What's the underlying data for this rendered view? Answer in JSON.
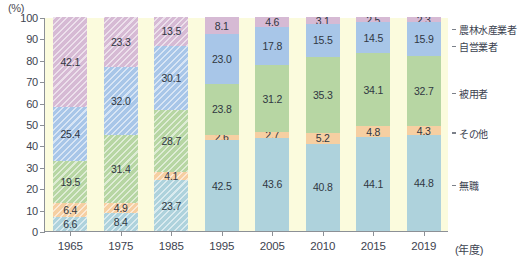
{
  "chart": {
    "type": "bar",
    "title": "",
    "unit_label": "(%)",
    "xlabel": "(年度)",
    "ylabel": "",
    "ylim": [
      0,
      100
    ],
    "ytick_labels": [
      "0",
      "10",
      "20",
      "30",
      "40",
      "50",
      "60",
      "70",
      "80",
      "90",
      "100"
    ],
    "grid": false,
    "legend_position": "right"
  },
  "chart_data": {
    "type": "bar",
    "stacked": true,
    "title": "",
    "xlabel": "(年度)",
    "ylabel": "(%)",
    "ylim": [
      0,
      100
    ],
    "categories": [
      "1965",
      "1975",
      "1985",
      "1995",
      "2005",
      "2010",
      "2015",
      "2019"
    ],
    "series": [
      {
        "name": "無職",
        "color": "#aed2dc",
        "values": [
          6.6,
          8.4,
          23.7,
          42.5,
          43.6,
          40.8,
          44.1,
          44.8
        ]
      },
      {
        "name": "その他",
        "color": "#f6cfa2",
        "values": [
          6.4,
          4.9,
          4.1,
          2.6,
          2.7,
          5.2,
          4.8,
          4.3
        ]
      },
      {
        "name": "被用者",
        "color": "#b7d6a3",
        "values": [
          19.5,
          31.4,
          28.7,
          23.8,
          31.2,
          35.3,
          34.1,
          32.7
        ]
      },
      {
        "name": "自営業者",
        "color": "#a8c6e8",
        "values": [
          25.4,
          32.0,
          30.1,
          23.0,
          17.8,
          15.5,
          14.5,
          15.9
        ]
      },
      {
        "name": "農林水産業者",
        "color": "#d6bad4",
        "values": [
          42.1,
          23.3,
          13.5,
          8.1,
          4.6,
          3.1,
          2.5,
          2.3
        ]
      }
    ],
    "hatched_categories": [
      "1965",
      "1975",
      "1985"
    ],
    "legend": [
      "農林水産業者",
      "自営業者",
      "被用者",
      "その他",
      "無職"
    ]
  },
  "legend": {
    "items": [
      {
        "label": "農林水産業者"
      },
      {
        "label": "自営業者"
      },
      {
        "label": "被用者"
      },
      {
        "label": "その他"
      },
      {
        "label": "無職"
      }
    ]
  },
  "colors": {
    "plot_background": "#fbfbdd",
    "axis": "#8c9096",
    "text": "#3d4350"
  }
}
